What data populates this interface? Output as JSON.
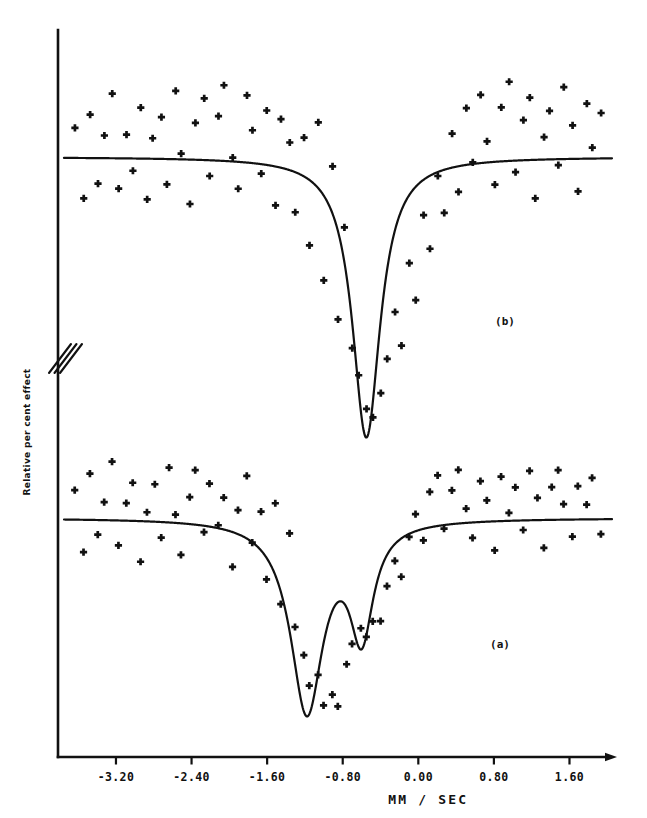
{
  "figure": {
    "background": "#ffffff",
    "ink": "#111111",
    "panel_labels": [
      {
        "name": "panel-b",
        "text": "(b)",
        "x": 505,
        "y": 325
      },
      {
        "name": "panel-a",
        "text": "(a)",
        "x": 500,
        "y": 648
      }
    ],
    "axis_break": {
      "present": true,
      "x": 58,
      "y": 358,
      "slashes": 3
    }
  },
  "chart_data": {
    "type": "scatter",
    "title": "",
    "subtitle": "",
    "xlabel": "MM / SEC",
    "ylabel": "Relative per cent effect",
    "xlim": [
      -3.75,
      2.05
    ],
    "ylim": [
      0,
      1
    ],
    "xticks": [
      -3.2,
      -2.4,
      -1.6,
      -0.8,
      0.0,
      0.8,
      1.6
    ],
    "xtick_labels": [
      "-3.20",
      "-2.40",
      "-1.60",
      "-0.80",
      "0.00",
      "0.80",
      "1.60"
    ],
    "yticks": [],
    "ytick_labels": [],
    "grid": false,
    "legend": "none",
    "series": [
      {
        "name": "(b)",
        "panel": "b",
        "marker": "cross",
        "baseline_percent": 0,
        "lines": [
          {
            "name": "fit-b",
            "component": "lorentzian",
            "center": -0.55,
            "fwhm": 0.36,
            "depth_percent": 4.35
          }
        ],
        "points_x": [
          -3.63,
          -3.55,
          -3.47,
          -3.4,
          -3.32,
          -3.25,
          -3.17,
          -3.1,
          -3.02,
          -2.95,
          -2.87,
          -2.8,
          -2.72,
          -2.65,
          -2.57,
          -2.5,
          -2.42,
          -2.35,
          -2.27,
          -2.2,
          -2.12,
          -2.05,
          -1.97,
          -1.9,
          -1.82,
          -1.75,
          -1.67,
          -1.6,
          -1.52,
          -1.45,
          -1.37,
          -1.3,
          -1.22,
          -1.15,
          -1.07,
          -1.0,
          -0.92,
          -0.85,
          -0.77,
          -0.7,
          -0.62,
          -0.55,
          -0.47,
          -0.4,
          -0.32,
          -0.25,
          -0.17,
          -0.1,
          -0.02,
          0.05,
          0.13,
          0.2,
          0.28,
          0.35,
          0.43,
          0.5,
          0.58,
          0.65,
          0.73,
          0.8,
          0.88,
          0.95,
          1.03,
          1.1,
          1.18,
          1.25,
          1.33,
          1.4,
          1.48,
          1.55,
          1.63,
          1.7,
          1.78,
          1.85,
          1.93
        ],
        "points_y": [
          0.45,
          -0.62,
          0.7,
          -0.35,
          0.28,
          0.95,
          -0.5,
          0.36,
          -0.18,
          0.82,
          -0.72,
          0.25,
          0.6,
          -0.42,
          1.05,
          0.1,
          -0.66,
          0.48,
          0.88,
          -0.3,
          0.65,
          1.15,
          0.05,
          -0.55,
          0.92,
          0.4,
          -0.25,
          0.75,
          -0.7,
          0.52,
          0.18,
          -0.88,
          0.3,
          -1.35,
          0.58,
          -1.85,
          -0.2,
          -2.55,
          -1.1,
          -2.95,
          -3.35,
          -3.85,
          -4.1,
          -3.7,
          -3.15,
          -2.4,
          -2.9,
          -1.6,
          -2.15,
          -0.95,
          -1.45,
          -0.3,
          -0.85,
          0.4,
          -0.48,
          0.7,
          -0.12,
          0.95,
          0.25,
          -0.4,
          0.82,
          1.1,
          -0.28,
          0.55,
          0.92,
          -0.62,
          0.35,
          0.78,
          -0.18,
          1.05,
          0.48,
          -0.52,
          0.86,
          0.2,
          0.62
        ]
      },
      {
        "name": "(a)",
        "panel": "a",
        "marker": "cross",
        "baseline_percent": 0,
        "lines": [
          {
            "name": "fit-a-component-1",
            "component": "lorentzian",
            "center": -1.18,
            "fwhm": 0.42,
            "depth_percent": 3.95
          },
          {
            "name": "fit-a-component-2",
            "component": "lorentzian",
            "center": -0.6,
            "fwhm": 0.3,
            "depth_percent": 2.25
          }
        ],
        "points_x": [
          -3.63,
          -3.55,
          -3.47,
          -3.4,
          -3.32,
          -3.25,
          -3.17,
          -3.1,
          -3.02,
          -2.95,
          -2.87,
          -2.8,
          -2.72,
          -2.65,
          -2.57,
          -2.5,
          -2.42,
          -2.35,
          -2.27,
          -2.2,
          -2.12,
          -2.05,
          -1.97,
          -1.9,
          -1.82,
          -1.75,
          -1.67,
          -1.6,
          -1.52,
          -1.45,
          -1.37,
          -1.3,
          -1.22,
          -1.15,
          -1.07,
          -1.0,
          -0.92,
          -0.85,
          -0.77,
          -0.7,
          -0.62,
          -0.55,
          -0.47,
          -0.4,
          -0.32,
          -0.25,
          -0.17,
          -0.1,
          -0.02,
          0.05,
          0.13,
          0.2,
          0.28,
          0.35,
          0.43,
          0.5,
          0.58,
          0.65,
          0.73,
          0.8,
          0.88,
          0.95,
          1.03,
          1.1,
          1.18,
          1.25,
          1.33,
          1.4,
          1.48,
          1.55,
          1.63,
          1.7,
          1.78,
          1.85,
          1.93
        ],
        "points_y": [
          0.55,
          -0.7,
          0.95,
          -0.28,
          0.42,
          1.1,
          -0.6,
          0.3,
          0.75,
          -0.85,
          0.2,
          0.62,
          -0.45,
          1.02,
          0.08,
          -0.72,
          0.5,
          0.9,
          -0.35,
          0.68,
          -0.15,
          0.45,
          -0.95,
          0.25,
          0.8,
          -0.55,
          0.12,
          -1.25,
          0.35,
          -1.7,
          -0.4,
          -2.3,
          -2.85,
          -3.45,
          -3.2,
          -3.8,
          -3.55,
          -3.95,
          -3.05,
          -2.6,
          -2.25,
          -2.4,
          -2.05,
          -2.2,
          -1.45,
          -0.9,
          -1.2,
          -0.35,
          0.15,
          -0.55,
          0.48,
          0.85,
          -0.22,
          0.6,
          1.05,
          0.28,
          -0.48,
          0.72,
          0.35,
          -0.65,
          0.9,
          0.18,
          0.55,
          -0.3,
          0.95,
          0.42,
          -0.58,
          0.7,
          1.08,
          0.22,
          -0.42,
          0.65,
          0.3,
          0.88,
          -0.25
        ]
      }
    ]
  }
}
